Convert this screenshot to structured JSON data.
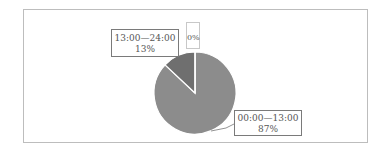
{
  "chart_data": {
    "type": "pie",
    "title": "",
    "categories": [
      "00:00—13:00",
      "13:00—24:00",
      ""
    ],
    "values": [
      87,
      13,
      0
    ],
    "labels": [
      "87%",
      "13%",
      "0%"
    ],
    "colors": [
      "#8c8c8c",
      "#6f6f6f",
      "#ffffff"
    ],
    "legend": "none",
    "start_angle_deg": 0,
    "direction": "clockwise"
  },
  "labels": {
    "slice_a": {
      "name": "00:00—13:00",
      "pct": "87%"
    },
    "slice_b": {
      "name": "13:00—24:00",
      "pct": "13%"
    },
    "slice_c": {
      "pct": "0%"
    }
  }
}
